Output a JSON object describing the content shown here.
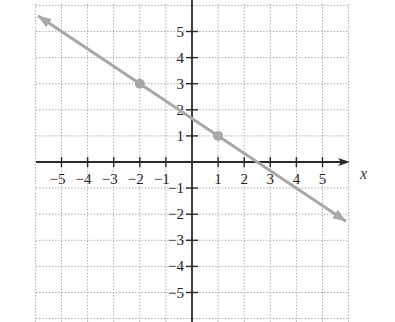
{
  "chart_data": {
    "type": "line",
    "title": "",
    "xlabel": "x",
    "ylabel": "",
    "xlim": [
      -5.8,
      6
    ],
    "ylim": [
      -6,
      6
    ],
    "grid": true,
    "x_ticks": [
      -5,
      -4,
      -3,
      -2,
      -1,
      1,
      2,
      3,
      4,
      5
    ],
    "y_ticks": [
      5,
      4,
      3,
      2,
      1,
      -1,
      -2,
      -3,
      -4,
      -5
    ],
    "x_tick_labels": [
      "−5",
      "−4",
      "−3",
      "−2",
      "−1",
      "1",
      "2",
      "3",
      "4",
      "5"
    ],
    "y_tick_labels": [
      "5",
      "4",
      "3",
      "2",
      "1",
      "−1",
      "−2",
      "−3",
      "−4",
      "−5"
    ],
    "series": [
      {
        "name": "line",
        "equation": "y = -2/3 x + 5/3",
        "slope": -0.6667,
        "intercept": 1.6667,
        "arrows": "both",
        "x": [
          -5.9,
          5.9
        ],
        "y": [
          5.6,
          -2.27
        ]
      }
    ],
    "points": [
      {
        "x": -2,
        "y": 3
      },
      {
        "x": 1,
        "y": 1
      }
    ],
    "colors": {
      "line": "#a8a8a8",
      "axes": "#2a2a2a",
      "grid": "#9a9a9a"
    }
  }
}
